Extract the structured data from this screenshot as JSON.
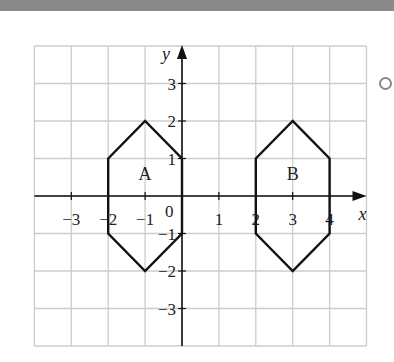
{
  "diagram": {
    "type": "coordinate-grid",
    "axes": {
      "x_label": "x",
      "y_label": "y",
      "x_range": [
        -4,
        5
      ],
      "y_range": [
        -4,
        4
      ],
      "origin_label": "0"
    },
    "x_ticks": [
      {
        "v": -3,
        "label": "−3"
      },
      {
        "v": -2,
        "label": "−2"
      },
      {
        "v": -1,
        "label": "−1"
      },
      {
        "v": 1,
        "label": "1"
      },
      {
        "v": 2,
        "label": "2"
      },
      {
        "v": 3,
        "label": "3"
      },
      {
        "v": 4,
        "label": "4"
      }
    ],
    "y_ticks": [
      {
        "v": 3,
        "label": "3"
      },
      {
        "v": 2,
        "label": "2"
      },
      {
        "v": 1,
        "label": "1"
      },
      {
        "v": -1,
        "label": "−1"
      },
      {
        "v": -2,
        "label": "−2"
      },
      {
        "v": -3,
        "label": "−3"
      }
    ],
    "shapes": [
      {
        "name": "A",
        "vertices": [
          [
            -2,
            1
          ],
          [
            -1,
            2
          ],
          [
            0,
            1
          ],
          [
            0,
            -1
          ],
          [
            -1,
            -2
          ],
          [
            -2,
            -1
          ]
        ],
        "label_pos": [
          -1,
          0.6
        ]
      },
      {
        "name": "B",
        "vertices": [
          [
            2,
            1
          ],
          [
            3,
            2
          ],
          [
            4,
            1
          ],
          [
            4,
            -1
          ],
          [
            3,
            -2
          ],
          [
            2,
            -1
          ]
        ],
        "label_pos": [
          3,
          0.6
        ]
      }
    ],
    "colors": {
      "grid": "#cccccc",
      "axis": "#111111",
      "shape": "#111111",
      "topbar": "#8a8a8a"
    }
  }
}
